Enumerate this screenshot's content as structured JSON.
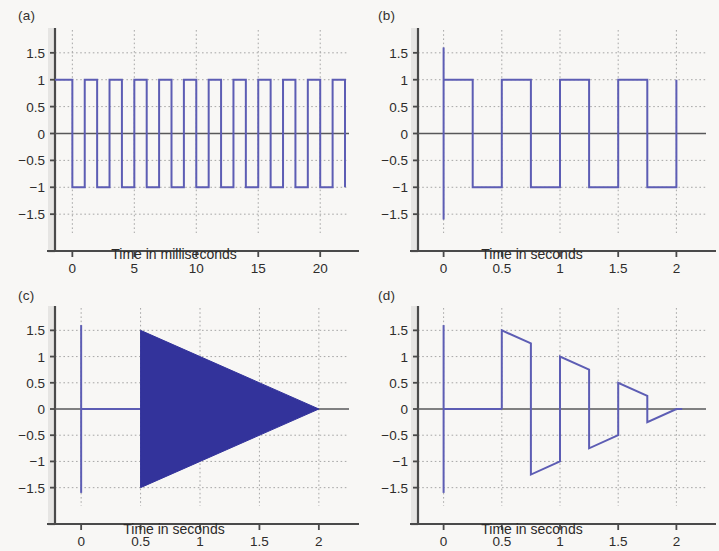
{
  "figure": {
    "background_color": "#f8f7f5",
    "line_color": "#5d5db4",
    "fill_color": "#33339b",
    "axis_color": "#4a4a4a",
    "grid_color": "#9a9a9a",
    "zero_line_color": "#58585a",
    "text_color": "#2e2c2b"
  },
  "panels": {
    "a": {
      "label": "(a)",
      "xlabel": "Time in milliseconds",
      "yticks": [
        "1.5",
        "1",
        "0.5",
        "0",
        "−0.5",
        "−1",
        "−1.5"
      ],
      "xticks": [
        "0",
        "5",
        "10",
        "15",
        "20"
      ]
    },
    "b": {
      "label": "(b)",
      "xlabel": "Time in seconds",
      "yticks": [
        "1.5",
        "1",
        "0.5",
        "0",
        "−0.5",
        "−1",
        "−1.5"
      ],
      "xticks": [
        "0",
        "0.5",
        "1",
        "1.5",
        "2"
      ]
    },
    "c": {
      "label": "(c)",
      "xlabel": "Time in seconds",
      "yticks": [
        "1.5",
        "1",
        "0.5",
        "0",
        "−0.5",
        "−1",
        "−1.5"
      ],
      "xticks": [
        "0",
        "0.5",
        "1",
        "1.5",
        "2"
      ]
    },
    "d": {
      "label": "(d)",
      "xlabel": "Time in seconds",
      "yticks": [
        "1.5",
        "1",
        "0.5",
        "0",
        "−0.5",
        "−1",
        "−1.5"
      ],
      "xticks": [
        "0",
        "0.5",
        "1",
        "1.5",
        "2"
      ]
    }
  },
  "chart_data": [
    {
      "type": "line",
      "panel": "a",
      "title": "(a)",
      "xlabel": "Time in milliseconds",
      "ylabel": "",
      "xlim": [
        -1.4,
        22.0
      ],
      "ylim": [
        -1.85,
        1.85
      ],
      "xticks": [
        0,
        5,
        10,
        15,
        20
      ],
      "yticks": [
        -1.5,
        -1,
        -0.5,
        0,
        0.5,
        1,
        1.5
      ],
      "grid": true,
      "legend": "none",
      "description": "500 Hz bipolar square wave of amplitude 1, period 2 ms, 50% duty cycle, high from t=-1.4 to 0 then alternating.",
      "series": [
        {
          "name": "square-wave-500Hz",
          "waveform": "square",
          "amplitude": 1,
          "period_ms": 2.0,
          "duty": 0.5,
          "start_level": 1,
          "x_start": -1.4,
          "x_end": 22.0,
          "first_transition_x": 0.0
        }
      ]
    },
    {
      "type": "line",
      "panel": "b",
      "title": "(b)",
      "xlabel": "Time in seconds",
      "ylabel": "",
      "xlim": [
        -0.22,
        2.22
      ],
      "ylim": [
        -1.85,
        1.85
      ],
      "xticks": [
        0,
        0.5,
        1,
        1.5,
        2
      ],
      "yticks": [
        -1.5,
        -1,
        -0.5,
        0,
        0.5,
        1,
        1.5
      ],
      "grid": true,
      "legend": "none",
      "description": "2 Hz bipolar square wave of amplitude 1 starting at t=0, preceded by a vertical impulse spike spanning -1.6 to +1.6 at t=0.",
      "series": [
        {
          "name": "square-wave-2Hz",
          "waveform": "square",
          "amplitude": 1,
          "period_s": 0.5,
          "duty": 0.5,
          "start_level": 1,
          "x_start": 0.0,
          "x_end": 2.0
        },
        {
          "name": "impulse-spike-at-zero",
          "x": 0.0,
          "y_min": -1.6,
          "y_max": 1.6
        }
      ]
    },
    {
      "type": "area",
      "panel": "c",
      "title": "(c)",
      "xlabel": "Time in seconds",
      "ylabel": "",
      "xlim": [
        -0.22,
        2.22
      ],
      "ylim": [
        -1.85,
        1.85
      ],
      "xticks": [
        0,
        0.5,
        1,
        1.5,
        2
      ],
      "yticks": [
        -1.5,
        -1,
        -0.5,
        0,
        0.5,
        1,
        1.5
      ],
      "grid": true,
      "legend": "none",
      "description": "Impulse spike at t=0 from -1.6 to +1.6; signal is zero until t=0.5, then a very high frequency oscillation whose envelope decays linearly from +/-1.5 at t=0.5 to 0 at t=2, rendered as a solid filled triangle.",
      "series": [
        {
          "name": "impulse-spike-at-zero",
          "x": 0.0,
          "y_min": -1.6,
          "y_max": 1.6
        },
        {
          "name": "zero-segment",
          "x_start": 0.0,
          "x_end": 0.5,
          "y": 0
        },
        {
          "name": "decaying-oscillation-envelope",
          "envelope_x": [
            0.5,
            2.0
          ],
          "envelope_upper": [
            1.5,
            0.0
          ],
          "envelope_lower": [
            -1.5,
            0.0
          ],
          "fill": true
        }
      ]
    },
    {
      "type": "line",
      "panel": "d",
      "title": "(d)",
      "xlabel": "Time in seconds",
      "ylabel": "",
      "xlim": [
        -0.22,
        2.22
      ],
      "ylim": [
        -1.85,
        1.85
      ],
      "xticks": [
        0,
        0.5,
        1,
        1.5,
        2
      ],
      "yticks": [
        -1.5,
        -1,
        -0.5,
        0,
        0.5,
        1,
        1.5
      ],
      "grid": true,
      "legend": "none",
      "description": "Impulse spike at t=0 from -1.6 to +1.6; zero until t=0.5; then a decaying sawtooth of period 0.5 s whose peak amplitude falls 1.5, 1.0, 0.5, 0.25 and reaches 0 at t=2.",
      "series": [
        {
          "name": "impulse-spike-at-zero",
          "x": 0.0,
          "y_min": -1.6,
          "y_max": 1.6
        },
        {
          "name": "zero-segment",
          "x_start": 0.0,
          "x_end": 0.5,
          "y": 0
        },
        {
          "name": "decaying-sawtooth",
          "period_s": 0.5,
          "points_x": [
            0.5,
            0.5,
            0.75,
            0.75,
            1.0,
            1.0,
            1.0,
            1.25,
            1.25,
            1.5,
            1.5,
            1.5,
            1.75,
            1.75,
            2.0,
            2.05
          ],
          "points_y": [
            0,
            1.5,
            1.25,
            -1.25,
            -1.0,
            1.0,
            1.0,
            0.75,
            -0.75,
            -0.5,
            0.5,
            0.5,
            0.25,
            -0.25,
            0,
            0
          ],
          "peak_amplitudes": [
            1.5,
            1.0,
            0.5,
            0.25
          ]
        }
      ]
    }
  ]
}
